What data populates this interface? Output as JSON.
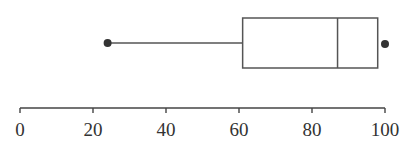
{
  "chart_data": {
    "type": "boxplot",
    "title": "",
    "xlabel": "",
    "ylabel": "",
    "orientation": "horizontal",
    "xlim": [
      0,
      100
    ],
    "ticks": [
      0,
      20,
      40,
      60,
      80,
      100
    ],
    "tick_labels": [
      "0",
      "20",
      "40",
      "60",
      "80",
      "100"
    ],
    "grid": false,
    "legend": null,
    "series": [
      {
        "name": "",
        "whisker_low": 24,
        "q1": 61,
        "median": 87,
        "q3": 98,
        "whisker_high": 98,
        "points": [
          24,
          100
        ]
      }
    ]
  },
  "colors": {
    "stroke": "#555555",
    "point": "#333333",
    "axis": "#444444"
  }
}
